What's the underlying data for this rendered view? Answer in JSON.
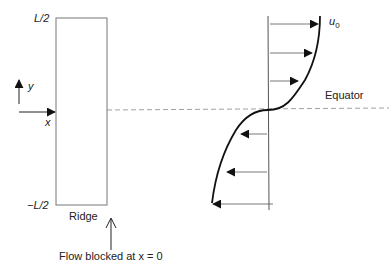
{
  "ridge": {
    "top_label": "L/2",
    "bottom_label": "−L/2",
    "name_label": "Ridge"
  },
  "axes": {
    "y_label": "y",
    "x_label": "x"
  },
  "profile": {
    "velocity_label": "u",
    "velocity_subscript": "0",
    "equator_label": "Equator"
  },
  "annotation": {
    "flow_blocked": "Flow blocked at x = 0"
  },
  "colors": {
    "line": "#222222",
    "ridge_border": "#777777",
    "dashed": "#888888"
  }
}
